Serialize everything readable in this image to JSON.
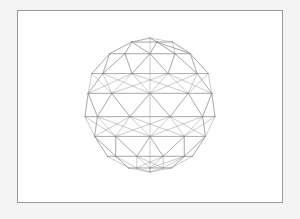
{
  "viewport": {
    "background_color": "#f4f4f4",
    "canvas_color": "#ffffff",
    "frame": {
      "x": 17,
      "y": 10,
      "width": 266,
      "height": 193,
      "border_color": "#9a9a9a",
      "border_width": 1
    }
  },
  "scene": {
    "object_name": "geodesic-sphere",
    "shading_mode": "wireframe",
    "edge_color": "#8a8a8a",
    "edge_width": 0.45,
    "fill": "none",
    "center_x": 150,
    "center_y": 105,
    "radius_x": 66,
    "radius_y": 67,
    "projection": "orthographic",
    "geometry": {
      "type": "icosphere",
      "subdivisions": 2,
      "latitude_bands": 9,
      "longitude_segments": 10,
      "vertex_count": 92,
      "edge_count": 270,
      "face_count": 180
    }
  },
  "chart_data": {
    "type": "scatter",
    "title": "",
    "xlabel": "",
    "ylabel": "",
    "note": "3D geodesic sphere wireframe, orthographic projection",
    "latitude_rings_deg": [
      90,
      70,
      50,
      28,
      10,
      -10,
      -28,
      -50,
      -70,
      -90
    ],
    "ring_point_counts": [
      1,
      5,
      10,
      10,
      10,
      10,
      10,
      10,
      5,
      1
    ],
    "longitude_offsets_deg": [
      0,
      0,
      18,
      0,
      18,
      0,
      18,
      0,
      18,
      0
    ]
  }
}
